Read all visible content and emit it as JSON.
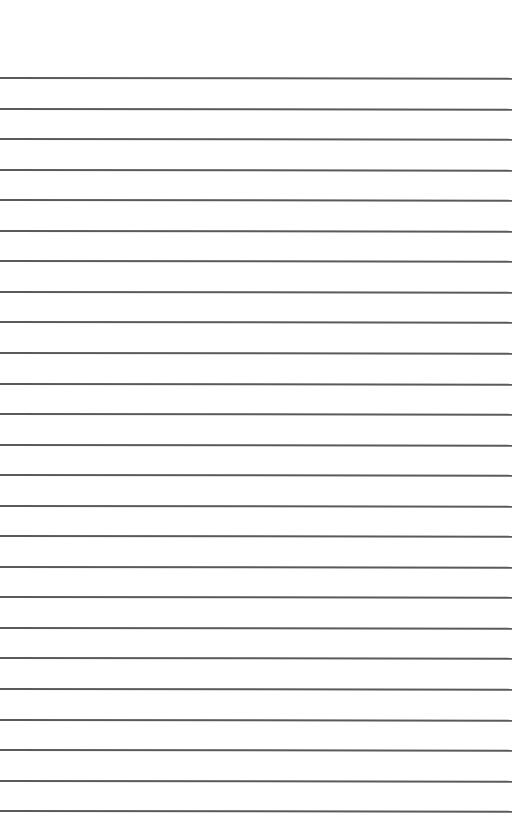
{
  "page": {
    "type": "lined-paper",
    "background_color": "#ffffff",
    "line_color": "#5a5a5a",
    "line_count": 25,
    "first_line_y": 77,
    "line_spacing": 30.55,
    "line_width": 512
  }
}
